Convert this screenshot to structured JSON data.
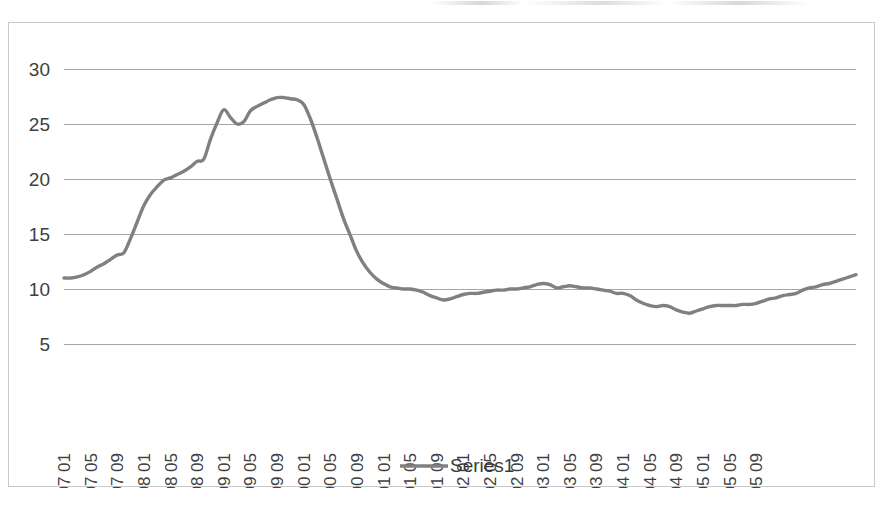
{
  "chart_data": {
    "type": "line",
    "title": "",
    "xlabel": "",
    "ylabel": "",
    "ylim": [
      5,
      30
    ],
    "yticks": [
      5,
      10,
      15,
      20,
      25,
      30
    ],
    "grid": true,
    "legend_position": "bottom",
    "legend": [
      "Series1"
    ],
    "series_name": "Series1",
    "series_color": "#808080",
    "x_tick_interval_months": 4,
    "x_tick_labels": [
      "1997 01",
      "1997 05",
      "1997 09",
      "1998 01",
      "1998 05",
      "1998 09",
      "1999 01",
      "1999 05",
      "1999 09",
      "2000 01",
      "2000 05",
      "2000 09",
      "2001 01",
      "2001 05",
      "2001 09",
      "2002 01",
      "2002 05",
      "2002 09",
      "2003 01",
      "2003 05",
      "2003 09",
      "2004 01",
      "2004 05",
      "2004 09",
      "2005 01",
      "2005 05",
      "2005 09"
    ],
    "x_labels_all": [
      "1997 01",
      "1997 02",
      "1997 03",
      "1997 04",
      "1997 05",
      "1997 06",
      "1997 07",
      "1997 08",
      "1997 09",
      "1997 10",
      "1997 11",
      "1997 12",
      "1998 01",
      "1998 02",
      "1998 03",
      "1998 04",
      "1998 05",
      "1998 06",
      "1998 07",
      "1998 08",
      "1998 09",
      "1998 10",
      "1998 11",
      "1998 12",
      "1999 01",
      "1999 02",
      "1999 03",
      "1999 04",
      "1999 05",
      "1999 06",
      "1999 07",
      "1999 08",
      "1999 09",
      "1999 10",
      "1999 11",
      "1999 12",
      "2000 01",
      "2000 02",
      "2000 03",
      "2000 04",
      "2000 05",
      "2000 06",
      "2000 07",
      "2000 08",
      "2000 09",
      "2000 10",
      "2000 11",
      "2000 12",
      "2001 01",
      "2001 02",
      "2001 03",
      "2001 04",
      "2001 05",
      "2001 06",
      "2001 07",
      "2001 08",
      "2001 09",
      "2001 10",
      "2001 11",
      "2001 12",
      "2002 01",
      "2002 02",
      "2002 03",
      "2002 04",
      "2002 05",
      "2002 06",
      "2002 07",
      "2002 08",
      "2002 09",
      "2002 10",
      "2002 11",
      "2002 12",
      "2003 01",
      "2003 02",
      "2003 03",
      "2003 04",
      "2003 05",
      "2003 06",
      "2003 07",
      "2003 08",
      "2003 09",
      "2003 10",
      "2003 11",
      "2003 12",
      "2004 01",
      "2004 02",
      "2004 03",
      "2004 04",
      "2004 05",
      "2004 06",
      "2004 07",
      "2004 08",
      "2004 09",
      "2004 10",
      "2004 11",
      "2004 12",
      "2005 01",
      "2005 02",
      "2005 03",
      "2005 04",
      "2005 05",
      "2005 06",
      "2005 07",
      "2005 08",
      "2005 09",
      "2005 10",
      "2005 11",
      "2005 12"
    ],
    "values": [
      11.0,
      11.0,
      11.1,
      11.3,
      11.6,
      12.0,
      12.3,
      12.7,
      13.1,
      13.3,
      14.6,
      16.1,
      17.6,
      18.6,
      19.3,
      19.9,
      20.1,
      20.4,
      20.7,
      21.1,
      21.6,
      21.8,
      23.6,
      25.1,
      26.3,
      25.6,
      25.0,
      25.2,
      26.2,
      26.6,
      26.9,
      27.2,
      27.4,
      27.4,
      27.3,
      27.2,
      26.8,
      25.5,
      23.8,
      21.9,
      20.0,
      18.2,
      16.4,
      14.9,
      13.4,
      12.3,
      11.5,
      10.9,
      10.5,
      10.2,
      10.1,
      10.0,
      10.0,
      9.9,
      9.7,
      9.4,
      9.2,
      9.0,
      9.1,
      9.3,
      9.5,
      9.6,
      9.6,
      9.7,
      9.8,
      9.9,
      9.9,
      10.0,
      10.0,
      10.1,
      10.2,
      10.4,
      10.5,
      10.4,
      10.1,
      10.2,
      10.3,
      10.2,
      10.1,
      10.1,
      10.0,
      9.9,
      9.8,
      9.6,
      9.6,
      9.4,
      9.0,
      8.7,
      8.5,
      8.4,
      8.5,
      8.4,
      8.1,
      7.9,
      7.8,
      8.0,
      8.2,
      8.4,
      8.5,
      8.5,
      8.5,
      8.5,
      8.6,
      8.6,
      8.7,
      8.9,
      9.1,
      9.2,
      9.4,
      9.5,
      9.6,
      9.9,
      10.1,
      10.2,
      10.4,
      10.5,
      10.7,
      10.9,
      11.1,
      11.3
    ]
  },
  "legend": {
    "series1_label": "Series1"
  }
}
